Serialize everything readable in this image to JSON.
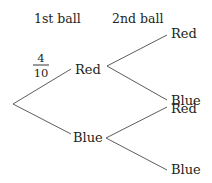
{
  "headers": {
    "first": "1st ball",
    "second": "2nd ball"
  },
  "tree": {
    "first_level": [
      {
        "label": "Red",
        "probability": {
          "numerator": "4",
          "denominator": "10"
        }
      },
      {
        "label": "Blue"
      }
    ],
    "second_level": {
      "after_red": [
        {
          "label": "Red"
        },
        {
          "label": "Blue"
        }
      ],
      "after_blue": [
        {
          "label": "Red"
        },
        {
          "label": "Blue"
        }
      ]
    }
  }
}
